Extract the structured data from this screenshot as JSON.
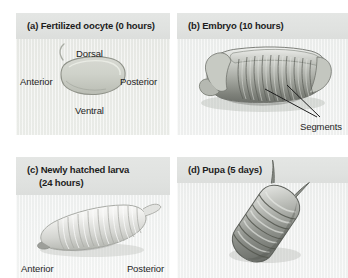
{
  "figure": {
    "background": "#ffffff",
    "panel_background": "#eef0ef",
    "title_band_color": "#e0e2e0",
    "text_color": "#1d1d1d"
  },
  "panels": [
    {
      "id": "a",
      "title": "(a) Fertilized oocyte (0 hours)",
      "subject": "fertilized-oocyte",
      "labels": {
        "dorsal": "Dorsal",
        "ventral": "Ventral",
        "anterior": "Anterior",
        "posterior": "Posterior"
      }
    },
    {
      "id": "b",
      "title": "(b) Embryo (10 hours)",
      "subject": "segmented-embryo",
      "labels": {
        "segments": "Segments"
      }
    },
    {
      "id": "c",
      "title_line1": "(c) Newly hatched larva",
      "title_line2": "(24 hours)",
      "subject": "larva",
      "labels": {
        "anterior": "Anterior",
        "posterior": "Posterior"
      }
    },
    {
      "id": "d",
      "title": "(d) Pupa (5 days)",
      "subject": "pupa",
      "labels": {}
    }
  ]
}
